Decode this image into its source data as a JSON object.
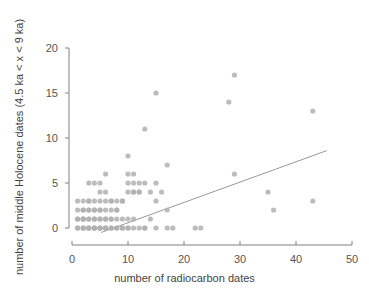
{
  "chart_data": {
    "type": "scatter",
    "title": "",
    "xlabel": "number of radiocarbon dates",
    "ylabel": "number of middle Holocene dates (4.5 ka < x < 9 ka)",
    "xlim": [
      0,
      50
    ],
    "ylim": [
      0,
      20
    ],
    "xticks": [
      0,
      10,
      20,
      30,
      40,
      50
    ],
    "yticks": [
      0,
      5,
      10,
      15,
      20
    ],
    "grid": false,
    "legend": null,
    "point_color": "#b0b0b0",
    "point_radius": 2.6,
    "axis_color": "#808080",
    "trendline": {
      "type": "line",
      "color": "#999999",
      "x_start": 5.2,
      "y_start": -0.5,
      "x_end": 45.5,
      "y_end": 8.6
    },
    "points": [
      [
        1,
        0
      ],
      [
        1,
        0
      ],
      [
        1,
        1
      ],
      [
        1,
        1
      ],
      [
        1,
        2
      ],
      [
        1,
        3
      ],
      [
        2,
        0
      ],
      [
        2,
        0
      ],
      [
        2,
        1
      ],
      [
        2,
        1
      ],
      [
        2,
        2
      ],
      [
        2,
        2
      ],
      [
        2,
        3
      ],
      [
        2,
        0
      ],
      [
        2,
        1
      ],
      [
        3,
        0
      ],
      [
        3,
        0
      ],
      [
        3,
        1
      ],
      [
        3,
        1
      ],
      [
        3,
        2
      ],
      [
        3,
        2
      ],
      [
        3,
        3
      ],
      [
        3,
        3
      ],
      [
        3,
        0
      ],
      [
        3,
        5
      ],
      [
        4,
        0
      ],
      [
        4,
        0
      ],
      [
        4,
        1
      ],
      [
        4,
        1
      ],
      [
        4,
        2
      ],
      [
        4,
        2
      ],
      [
        4,
        3
      ],
      [
        4,
        5
      ],
      [
        4,
        0
      ],
      [
        5,
        0
      ],
      [
        5,
        0
      ],
      [
        5,
        1
      ],
      [
        5,
        1
      ],
      [
        5,
        2
      ],
      [
        5,
        3
      ],
      [
        5,
        4
      ],
      [
        5,
        5
      ],
      [
        5,
        0
      ],
      [
        5,
        2
      ],
      [
        6,
        0
      ],
      [
        6,
        0
      ],
      [
        6,
        1
      ],
      [
        6,
        1
      ],
      [
        6,
        2
      ],
      [
        6,
        3
      ],
      [
        6,
        4
      ],
      [
        6,
        6
      ],
      [
        6,
        0
      ],
      [
        7,
        0
      ],
      [
        7,
        0
      ],
      [
        7,
        1
      ],
      [
        7,
        1
      ],
      [
        7,
        2
      ],
      [
        7,
        3
      ],
      [
        7,
        3
      ],
      [
        8,
        0
      ],
      [
        8,
        0
      ],
      [
        8,
        1
      ],
      [
        8,
        2
      ],
      [
        8,
        3
      ],
      [
        8,
        2
      ],
      [
        9,
        0
      ],
      [
        9,
        0
      ],
      [
        9,
        1
      ],
      [
        9,
        3
      ],
      [
        9,
        3
      ],
      [
        10,
        0
      ],
      [
        10,
        0
      ],
      [
        10,
        1
      ],
      [
        10,
        4
      ],
      [
        10,
        5
      ],
      [
        10,
        6
      ],
      [
        10,
        8
      ],
      [
        11,
        0
      ],
      [
        11,
        1
      ],
      [
        11,
        4
      ],
      [
        11,
        4
      ],
      [
        11,
        5
      ],
      [
        11,
        6
      ],
      [
        12,
        0
      ],
      [
        12,
        4
      ],
      [
        12,
        4
      ],
      [
        12,
        5
      ],
      [
        13,
        0
      ],
      [
        13,
        0
      ],
      [
        13,
        5
      ],
      [
        13,
        11
      ],
      [
        14,
        1
      ],
      [
        14,
        4
      ],
      [
        15,
        0
      ],
      [
        15,
        3
      ],
      [
        15,
        5
      ],
      [
        15,
        15
      ],
      [
        16,
        4
      ],
      [
        17,
        0
      ],
      [
        17,
        2
      ],
      [
        17,
        7
      ],
      [
        18,
        0
      ],
      [
        22,
        0
      ],
      [
        23,
        0
      ],
      [
        28,
        14
      ],
      [
        29,
        6
      ],
      [
        29,
        17
      ],
      [
        35,
        4
      ],
      [
        36,
        2
      ],
      [
        43,
        3
      ],
      [
        43,
        13
      ]
    ]
  },
  "axis": {
    "x_tick_labels": [
      "0",
      "10",
      "20",
      "30",
      "40",
      "50"
    ],
    "y_tick_labels": [
      "0",
      "5",
      "10",
      "15",
      "20"
    ],
    "x_title": "number of radiocarbon dates",
    "y_title": "number of middle Holocene dates (4.5 ka < x < 9 ka)"
  }
}
